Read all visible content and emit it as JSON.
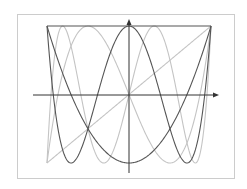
{
  "chart_data": {
    "type": "line",
    "title": "",
    "xlabel": "",
    "ylabel": "",
    "xlim": [
      -1,
      1
    ],
    "ylim": [
      -1,
      1
    ],
    "grid": false,
    "legend": null,
    "frame": true,
    "axes_arrows": true,
    "series": [
      {
        "name": "T0",
        "formula": "1",
        "color": "#555555"
      },
      {
        "name": "T1",
        "formula": "x",
        "color": "#c4c4c4"
      },
      {
        "name": "T2",
        "formula": "2x^2-1",
        "color": "#555555"
      },
      {
        "name": "T3",
        "formula": "4x^3-3x",
        "color": "#c4c4c4"
      },
      {
        "name": "T4",
        "formula": "8x^4-8x^2+1",
        "color": "#555555"
      },
      {
        "name": "T5",
        "formula": "16x^5-20x^3+5x",
        "color": "#c4c4c4"
      }
    ]
  },
  "colors": {
    "frame": "#cccccc",
    "axis": "#333333",
    "dark_curve": "#555555",
    "light_curve": "#c4c4c4"
  }
}
